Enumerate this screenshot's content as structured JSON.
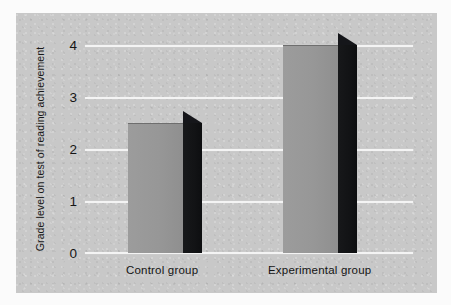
{
  "chart_data": {
    "type": "bar",
    "title": "",
    "subtitle": "",
    "xlabel": "",
    "ylabel": "Grade level on test of reading achievement",
    "categories": [
      "Control group",
      "Experimental group"
    ],
    "values": [
      2.5,
      4
    ],
    "ylim": [
      0,
      4
    ],
    "yticks": [
      0,
      1,
      2,
      3,
      4
    ],
    "ytick_labels": [
      "0",
      "1",
      "2",
      "3",
      "4"
    ],
    "grid": true,
    "legend": "none",
    "style": "3d-bar",
    "colors": {
      "bar_front": "#979797",
      "bar_side": "#141518",
      "panel_background": "#c8c8c8",
      "gridline": "#f4f4f4",
      "text": "#161616",
      "page_background": "#fbfbfb"
    }
  },
  "axis": {
    "y_title": "Grade level on test of reading achievement",
    "ticks": [
      {
        "label": "4",
        "value": 4
      },
      {
        "label": "3",
        "value": 3
      },
      {
        "label": "2",
        "value": 2
      },
      {
        "label": "1",
        "value": 1
      },
      {
        "label": "0",
        "value": 0
      }
    ]
  },
  "bars": [
    {
      "label": "Control group",
      "value": 2.5
    },
    {
      "label": "Experimental group",
      "value": 4
    }
  ]
}
